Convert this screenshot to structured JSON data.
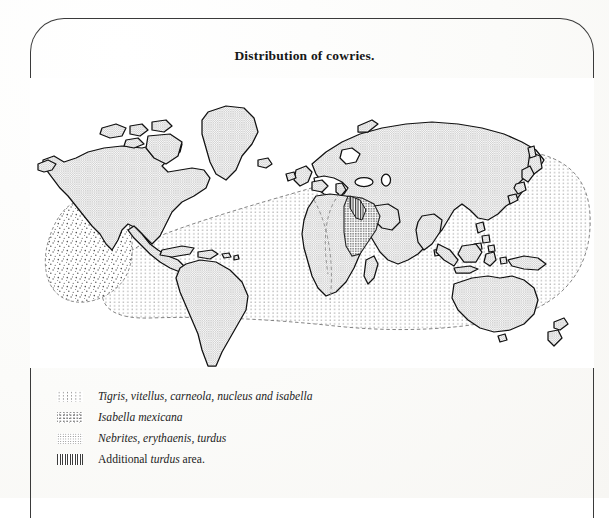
{
  "figure": {
    "title": "Distribution of cowries.",
    "frame_color": "#3a3a3a",
    "paper_color": "#fdfdfb"
  },
  "map": {
    "projection": "world-mercator-schematic",
    "land_fill": "#d6d6d6",
    "land_outline": "#111111",
    "ocean_fill": "#ffffff",
    "regions": [
      {
        "name": "indo-pacific-tigris-region",
        "pattern": "sparse-dots",
        "label": "Tigris, vitellus, carneola, nucleus and isabella",
        "boundary": "dashed"
      },
      {
        "name": "isabella-mexicana-region",
        "pattern": "scatter-dots",
        "label": "Isabella mexicana",
        "boundary": "dashed"
      },
      {
        "name": "nebrites-erythaenis-turdus-region",
        "pattern": "dense-dots",
        "label": "Nebrites, erythaenis, turdus",
        "boundary": "solid"
      },
      {
        "name": "additional-turdus-area",
        "pattern": "vertical-hatch",
        "label": "Additional turdus area.",
        "boundary": "solid"
      }
    ],
    "landmasses": [
      "north-america",
      "south-america",
      "greenland",
      "iceland",
      "africa",
      "europe",
      "asia",
      "australia",
      "new-zealand",
      "madagascar",
      "japan",
      "philippines",
      "indonesia",
      "new-guinea",
      "british-isles",
      "caribbean-islands",
      "sri-lanka",
      "arctic-islands"
    ]
  },
  "legend": {
    "items": [
      {
        "swatch": "sparse-dots",
        "swatch_class": "sw-sparse-dots",
        "text": "Tigris, vitellus, carneola, nucleus and isabella",
        "style": "italic"
      },
      {
        "swatch": "scatter-dots",
        "swatch_class": "sw-scatter-dots",
        "text": "Isabella mexicana",
        "style": "italic"
      },
      {
        "swatch": "dense-dots",
        "swatch_class": "sw-dense-dots",
        "text": "Nebrites, erythaenis, turdus",
        "style": "italic"
      },
      {
        "swatch": "vertical-hatch",
        "swatch_class": "sw-hatch",
        "text_prefix": "Additional ",
        "text_italic": "turdus",
        "text_suffix": " area.",
        "style": "mixed"
      }
    ]
  }
}
